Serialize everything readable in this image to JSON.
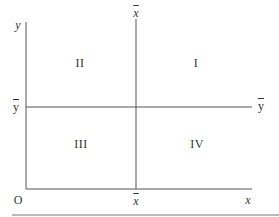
{
  "diagram": {
    "axes": {
      "y_label": "y",
      "x_label": "x",
      "origin_label": "O"
    },
    "mean_lines": {
      "x_mean_top_label": "x",
      "x_mean_bottom_label": "x",
      "y_mean_left_label": "y",
      "y_mean_right_label": "y"
    },
    "quadrants": {
      "top_right": "I",
      "top_left": "II",
      "bottom_left": "III",
      "bottom_right": "IV"
    },
    "colors": {
      "line": "#555555",
      "text": "#333333",
      "rule": "#777777"
    }
  }
}
